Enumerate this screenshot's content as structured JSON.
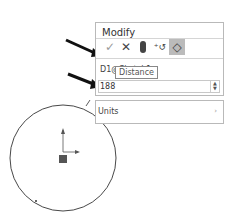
{
  "modify_dialog": {
    "title": "Modify",
    "toolbar": {
      "ok_icon": "checkmark-icon",
      "cancel_icon": "x-icon",
      "rebuild_icon": "traffic-light-icon",
      "reverse_icon": "reverse-sense-icon",
      "mark_icon": "mark-dimension-icon"
    },
    "dimension_name": "D1@Sketch1",
    "value": "188",
    "tooltip": "Distance"
  },
  "units_panel": {
    "label": "Units"
  }
}
